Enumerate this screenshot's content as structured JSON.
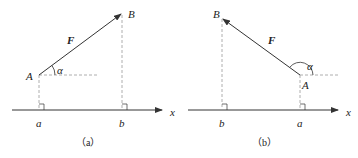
{
  "panels": [
    {
      "caption": "（a）",
      "force_label": "F",
      "point_start": "A",
      "point_end": "B",
      "angle_label": "α",
      "axis_label": "x",
      "proj_start": "a",
      "proj_end": "b"
    },
    {
      "caption": "（b）",
      "force_label": "F",
      "point_start": "A",
      "point_end": "B",
      "angle_label": "α",
      "axis_label": "x",
      "proj_start": "a",
      "proj_end": "b"
    }
  ],
  "colors": {
    "line": "#333333",
    "dash": "#999999"
  }
}
